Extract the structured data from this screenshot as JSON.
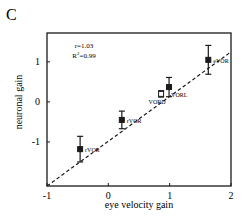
{
  "chart_data": {
    "type": "scatter",
    "panel_label": "C",
    "title": "",
    "xlabel": "eye velocity gain",
    "ylabel": "neuronal gain",
    "xlim": [
      -1,
      2
    ],
    "ylim": [
      -2.1,
      1.72
    ],
    "xticks": [
      -1,
      0,
      1,
      2
    ],
    "xtick_labels": [
      "-1",
      "0",
      "1",
      "2"
    ],
    "yticks": [
      -1,
      0,
      1
    ],
    "ytick_labels": [
      "-1",
      "0",
      "1"
    ],
    "grid": false,
    "annotations": [
      {
        "text": "r=1.03",
        "position": "top-left"
      },
      {
        "text": "R",
        "sup": "2",
        "suffix": "=0.99",
        "position": "top-left"
      }
    ],
    "fit_line": {
      "style": "dashed",
      "x": [
        -1,
        2
      ],
      "y": [
        -2.1,
        1.25
      ]
    },
    "points": [
      {
        "label": "rVOR",
        "x": -0.46,
        "y": -1.18,
        "err": 0.32,
        "marker": "filled-square"
      },
      {
        "label": "rVOR",
        "x": 0.22,
        "y": -0.45,
        "err": 0.22,
        "marker": "filled-square"
      },
      {
        "label": "VORD",
        "x": 0.86,
        "y": 0.2,
        "err": 0.08,
        "marker": "open-square"
      },
      {
        "label": "VORL",
        "x": 0.99,
        "y": 0.37,
        "err": 0.24,
        "marker": "filled-square"
      },
      {
        "label": "eVOR",
        "x": 1.63,
        "y": 1.05,
        "err": 0.36,
        "marker": "filled-square"
      }
    ]
  }
}
